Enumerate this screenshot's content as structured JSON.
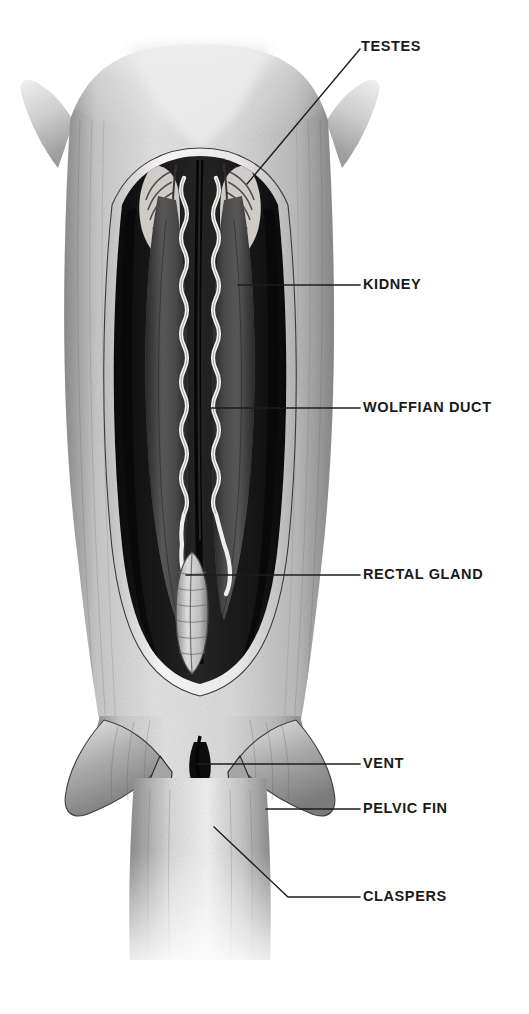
{
  "figure": {
    "background_color": "#ffffff",
    "ink_color": "#1d1d1d",
    "style": "grayscale pencil / airbrush scientific illustration"
  },
  "labels": [
    {
      "id": "testes",
      "text": "TESTES",
      "text_x": 361,
      "text_y": 47,
      "leader_points": "247,184 360,49",
      "anchor_part": "testis-left-upper-cavity"
    },
    {
      "id": "kidney",
      "text": "KIDNEY",
      "text_x": 363,
      "text_y": 285,
      "leader_points": "238,285 360,285",
      "anchor_part": "kidney-right-mass"
    },
    {
      "id": "wolffian-duct",
      "text": "WOLFFIAN DUCT",
      "text_x": 363,
      "text_y": 408,
      "leader_points": "210,408 360,408",
      "anchor_part": "wolffian-duct-right"
    },
    {
      "id": "rectal-gland",
      "text": "RECTAL GLAND",
      "text_x": 363,
      "text_y": 575,
      "leader_points": "186,575 360,575",
      "anchor_part": "rectal-gland"
    },
    {
      "id": "vent",
      "text": "VENT",
      "text_x": 363,
      "text_y": 764,
      "leader_points": "196,764 360,764",
      "anchor_part": "vent-cloaca"
    },
    {
      "id": "pelvic-fin",
      "text": "PELVIC FIN",
      "text_x": 363,
      "text_y": 809,
      "leader_points": "266,809 360,809",
      "anchor_part": "pelvic-fin-right"
    },
    {
      "id": "claspers",
      "text": "CLASPERS",
      "text_x": 363,
      "text_y": 897,
      "leader_points": "214,827 288,897 360,897",
      "anchor_part": "clasper-pair"
    }
  ],
  "anatomy": {
    "parts": [
      {
        "id": "body-wall",
        "name": "Body wall / flank musculature",
        "tone": "#b9b9b9"
      },
      {
        "id": "pectoral-fin-left",
        "name": "Left pectoral fin base",
        "tone": "#cfcfcf"
      },
      {
        "id": "pectoral-fin-right",
        "name": "Right pectoral fin base",
        "tone": "#cfcfcf"
      },
      {
        "id": "cavity",
        "name": "Opened body cavity",
        "tone": "#1b1b1b"
      },
      {
        "id": "cavity-rim",
        "name": "Cut edge of body wall",
        "tone": "#f2f2f2"
      },
      {
        "id": "testis-left",
        "name": "Left testis",
        "tone": "#e8e8e8"
      },
      {
        "id": "testis-right",
        "name": "Right testis",
        "tone": "#e8e8e8"
      },
      {
        "id": "kidney-left",
        "name": "Left kidney",
        "tone": "#4a4a4a"
      },
      {
        "id": "kidney-right",
        "name": "Right kidney",
        "tone": "#4a4a4a"
      },
      {
        "id": "wolffian-left",
        "name": "Left Wolffian duct",
        "tone": "#ededed"
      },
      {
        "id": "wolffian-right",
        "name": "Right Wolffian duct",
        "tone": "#ededed"
      },
      {
        "id": "midline",
        "name": "Dorsal midline groove",
        "tone": "#0d0d0d"
      },
      {
        "id": "rectal-gland",
        "name": "Rectal gland",
        "tone": "#d8d8d8"
      },
      {
        "id": "vent",
        "name": "Vent (cloacal opening)",
        "tone": "#101010"
      },
      {
        "id": "pelvic-left",
        "name": "Left pelvic fin",
        "tone": "#a8a8a8"
      },
      {
        "id": "pelvic-right",
        "name": "Right pelvic fin",
        "tone": "#a8a8a8"
      },
      {
        "id": "clasper-left",
        "name": "Left clasper",
        "tone": "#9a9a9a"
      },
      {
        "id": "clasper-right",
        "name": "Right clasper",
        "tone": "#9a9a9a"
      },
      {
        "id": "tail",
        "name": "Caudal peduncle",
        "tone": "#bcbcbc"
      }
    ]
  }
}
